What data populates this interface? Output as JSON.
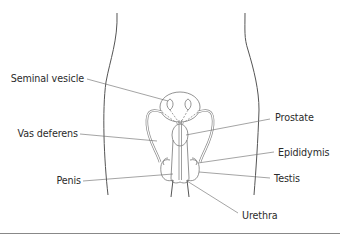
{
  "diagram": {
    "labels": {
      "seminal_vesicle": "Seminal vesicle",
      "vas_deferens": "Vas deferens",
      "penis": "Penis",
      "prostate": "Prostate",
      "epididymis": "Epididymis",
      "testis": "Testis",
      "urethra": "Urethra"
    },
    "colors": {
      "outline": "#555555",
      "leader": "#666666",
      "organ": "#8a8a8a",
      "text": "#2b2b2b",
      "bottom_rule": "#888888"
    }
  }
}
